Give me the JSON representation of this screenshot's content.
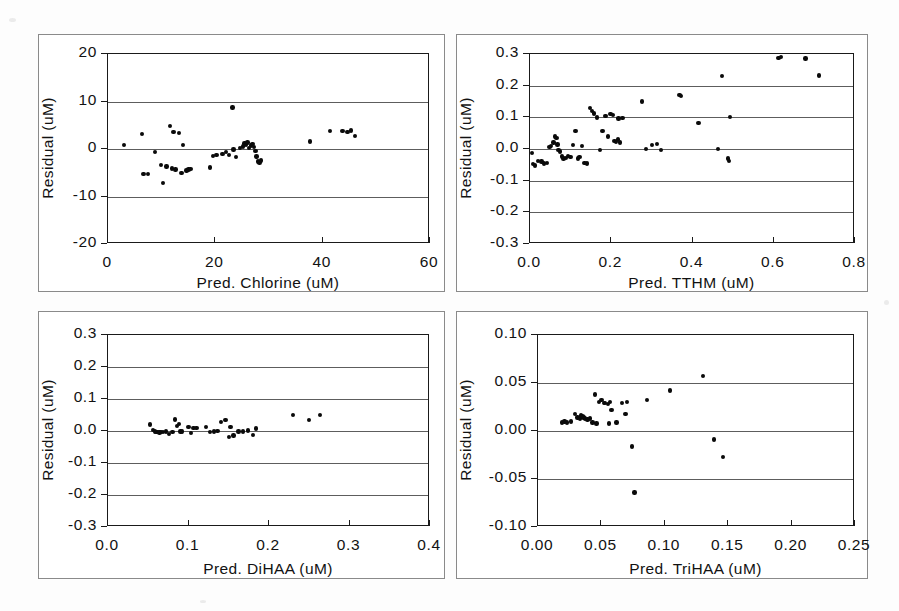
{
  "page": {
    "background_color": "#fdfdfd",
    "panel_border_color": "#8a8a8a",
    "axis_color": "#1a1a1a",
    "gridline_color": "#5d5d5d",
    "marker_color": "#0a0a0a"
  },
  "charts": [
    {
      "id": "chlorine",
      "panel": "top-left",
      "type": "scatter",
      "title": "",
      "xlabel": "Pred. Chlorine (uM)",
      "ylabel": "Residual (uM)",
      "xlim": [
        0,
        60
      ],
      "ylim": [
        -20,
        20
      ],
      "xticks": [
        0,
        20,
        40,
        60
      ],
      "xtick_labels": [
        "0",
        "20",
        "40",
        "60"
      ],
      "yticks": [
        -20,
        -10,
        0,
        10,
        20
      ],
      "ytick_labels": [
        "-20",
        "-10",
        "0",
        "10",
        "20"
      ],
      "grid": "horizontal",
      "legend": "none",
      "x": [
        3.0,
        6.3,
        6.6,
        7.4,
        8.7,
        9.9,
        10.3,
        10.9,
        11.6,
        11.9,
        12.2,
        12.6,
        13.2,
        13.7,
        14.0,
        14.6,
        15.0,
        15.4,
        19.0,
        19.6,
        20.2,
        21.3,
        22.0,
        22.6,
        23.2,
        23.4,
        23.8,
        24.6,
        25.1,
        25.4,
        25.7,
        26.0,
        26.3,
        26.6,
        26.9,
        27.2,
        27.5,
        27.7,
        28.0,
        28.2,
        28.5,
        37.6,
        41.4,
        43.7,
        44.6,
        45.3,
        46.0
      ],
      "y": [
        0.8,
        3.2,
        -5.3,
        -5.2,
        -0.6,
        -3.4,
        -7.2,
        -3.7,
        4.8,
        -4.1,
        3.6,
        -4.3,
        3.4,
        -5.1,
        0.9,
        -4.5,
        -4.3,
        -4.2,
        -3.9,
        -1.5,
        -1.3,
        -1.1,
        -0.6,
        -1.3,
        8.7,
        -0.1,
        -1.7,
        0.2,
        0.5,
        1.2,
        0.9,
        1.4,
        0.2,
        0.7,
        1.0,
        0.4,
        -0.4,
        -1.6,
        -2.6,
        -2.8,
        -2.4,
        1.6,
        3.8,
        3.8,
        3.6,
        3.9,
        2.7
      ]
    },
    {
      "id": "tthm",
      "panel": "top-right",
      "type": "scatter",
      "title": "",
      "xlabel": "Pred. TTHM (uM)",
      "ylabel": "Residual (uM)",
      "xlim": [
        0.0,
        0.8
      ],
      "ylim": [
        -0.3,
        0.3
      ],
      "xticks": [
        0.0,
        0.2,
        0.4,
        0.6,
        0.8
      ],
      "xtick_labels": [
        "0.0",
        "0.2",
        "0.4",
        "0.6",
        "0.8"
      ],
      "yticks": [
        -0.3,
        -0.2,
        -0.1,
        0.0,
        0.1,
        0.2,
        0.3
      ],
      "ytick_labels": [
        "-0.3",
        "-0.2",
        "-0.1",
        "0.0",
        "0.1",
        "0.2",
        "0.3"
      ],
      "grid": "horizontal",
      "legend": "none",
      "x": [
        0.005,
        0.008,
        0.012,
        0.02,
        0.028,
        0.034,
        0.042,
        0.048,
        0.052,
        0.058,
        0.062,
        0.065,
        0.068,
        0.07,
        0.074,
        0.078,
        0.082,
        0.088,
        0.094,
        0.1,
        0.106,
        0.112,
        0.118,
        0.122,
        0.128,
        0.134,
        0.14,
        0.148,
        0.152,
        0.158,
        0.165,
        0.172,
        0.178,
        0.186,
        0.192,
        0.198,
        0.204,
        0.208,
        0.212,
        0.216,
        0.218,
        0.222,
        0.228,
        0.276,
        0.285,
        0.3,
        0.312,
        0.322,
        0.368,
        0.372,
        0.415,
        0.462,
        0.472,
        0.488,
        0.49,
        0.492,
        0.612,
        0.618,
        0.678,
        0.712
      ],
      "y": [
        -0.012,
        -0.048,
        -0.052,
        -0.038,
        -0.04,
        -0.046,
        -0.045,
        0.006,
        0.01,
        0.02,
        0.04,
        0.034,
        0.014,
        -0.004,
        -0.008,
        -0.024,
        -0.03,
        -0.028,
        -0.022,
        -0.026,
        0.012,
        0.056,
        -0.03,
        -0.026,
        0.01,
        -0.044,
        -0.046,
        0.13,
        0.12,
        0.112,
        0.1,
        -0.004,
        0.056,
        0.104,
        0.04,
        0.11,
        0.108,
        0.026,
        0.022,
        0.03,
        0.096,
        0.02,
        0.098,
        0.15,
        0.0,
        0.012,
        0.016,
        -0.004,
        0.17,
        0.168,
        0.082,
        0.0,
        0.23,
        -0.03,
        -0.038,
        0.102,
        0.288,
        0.29,
        0.286,
        0.232
      ]
    },
    {
      "id": "dihaa",
      "panel": "bottom-left",
      "type": "scatter",
      "title": "",
      "xlabel": "Pred. DiHAA (uM)",
      "ylabel": "Residual (uM)",
      "xlim": [
        0.0,
        0.4
      ],
      "ylim": [
        -0.3,
        0.3
      ],
      "xticks": [
        0.0,
        0.1,
        0.2,
        0.3,
        0.4
      ],
      "xtick_labels": [
        "0.0",
        "0.1",
        "0.2",
        "0.3",
        "0.4"
      ],
      "yticks": [
        -0.3,
        -0.2,
        -0.1,
        0.0,
        0.1,
        0.2,
        0.3
      ],
      "ytick_labels": [
        "-0.3",
        "-0.2",
        "-0.1",
        "0.0",
        "0.1",
        "0.2",
        "0.3"
      ],
      "grid": "horizontal",
      "legend": "none",
      "x": [
        0.052,
        0.056,
        0.058,
        0.06,
        0.062,
        0.064,
        0.066,
        0.068,
        0.072,
        0.076,
        0.08,
        0.083,
        0.086,
        0.088,
        0.09,
        0.092,
        0.1,
        0.103,
        0.106,
        0.11,
        0.122,
        0.127,
        0.132,
        0.136,
        0.14,
        0.146,
        0.15,
        0.152,
        0.156,
        0.162,
        0.168,
        0.174,
        0.18,
        0.184,
        0.23,
        0.25,
        0.263
      ],
      "y": [
        0.02,
        0.004,
        -0.002,
        -0.004,
        -0.004,
        -0.005,
        -0.004,
        -0.003,
        -0.002,
        -0.01,
        -0.003,
        0.036,
        0.016,
        0.022,
        -0.002,
        -0.001,
        0.012,
        -0.006,
        0.01,
        0.01,
        0.012,
        -0.003,
        -0.002,
        0.0,
        0.028,
        0.034,
        -0.018,
        0.012,
        -0.014,
        -0.002,
        -0.002,
        0.002,
        -0.012,
        0.008,
        0.05,
        0.035,
        0.05
      ]
    },
    {
      "id": "trihaa",
      "panel": "bottom-right",
      "type": "scatter",
      "title": "",
      "xlabel": "Pred. TriHAA (uM)",
      "ylabel": "Residual (uM)",
      "xlim": [
        0.0,
        0.25
      ],
      "ylim": [
        -0.1,
        0.1
      ],
      "xticks": [
        0.0,
        0.05,
        0.1,
        0.15,
        0.2,
        0.25
      ],
      "xtick_labels": [
        "0.00",
        "0.05",
        "0.10",
        "0.15",
        "0.20",
        "0.25"
      ],
      "yticks": [
        -0.1,
        -0.05,
        0.0,
        0.05,
        0.1
      ],
      "ytick_labels": [
        "-0.10",
        "-0.05",
        "0.00",
        "0.05",
        "0.10"
      ],
      "grid": "horizontal",
      "legend": "none",
      "x": [
        0.019,
        0.021,
        0.023,
        0.026,
        0.029,
        0.031,
        0.033,
        0.034,
        0.035,
        0.036,
        0.037,
        0.039,
        0.041,
        0.043,
        0.045,
        0.046,
        0.048,
        0.05,
        0.052,
        0.053,
        0.055,
        0.056,
        0.057,
        0.058,
        0.062,
        0.066,
        0.069,
        0.07,
        0.074,
        0.076,
        0.086,
        0.104,
        0.13,
        0.139,
        0.146
      ],
      "y": [
        0.009,
        0.01,
        0.009,
        0.01,
        0.018,
        0.014,
        0.013,
        0.016,
        0.015,
        0.014,
        0.013,
        0.012,
        0.013,
        0.009,
        0.038,
        0.008,
        0.03,
        0.032,
        0.029,
        0.029,
        0.028,
        0.008,
        0.03,
        0.022,
        0.009,
        0.029,
        0.018,
        0.03,
        -0.016,
        -0.064,
        0.032,
        0.042,
        0.057,
        -0.009,
        -0.027
      ]
    }
  ]
}
